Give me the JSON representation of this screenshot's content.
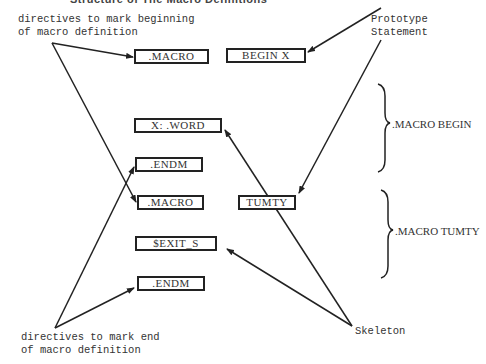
{
  "diagram": {
    "title": "Structure of The Macro Definitions",
    "annotations": {
      "begin_directives": [
        "directives to mark beginning",
        "of macro definition"
      ],
      "prototype": [
        "Prototype",
        "Statement"
      ],
      "end_directives": [
        "directives to mark end",
        "of macro definition"
      ],
      "skeleton": "Skeleton"
    },
    "boxes": [
      {
        "id": "macro1",
        "label": ".MACRO"
      },
      {
        "id": "begin_x",
        "label": "BEGIN X"
      },
      {
        "id": "x_word",
        "label": "X: .WORD"
      },
      {
        "id": "endm1",
        "label": ".ENDM"
      },
      {
        "id": "macro2",
        "label": ".MACRO"
      },
      {
        "id": "tumty",
        "label": "TUMTY"
      },
      {
        "id": "exit_s",
        "label": "$EXIT_S"
      },
      {
        "id": "endm2",
        "label": ".ENDM"
      }
    ],
    "braces": [
      {
        "label": ".MACRO BEGIN"
      },
      {
        "label": ".MACRO TUMTY"
      }
    ],
    "colors": {
      "ink": "#222222",
      "background": "#ffffff"
    }
  }
}
